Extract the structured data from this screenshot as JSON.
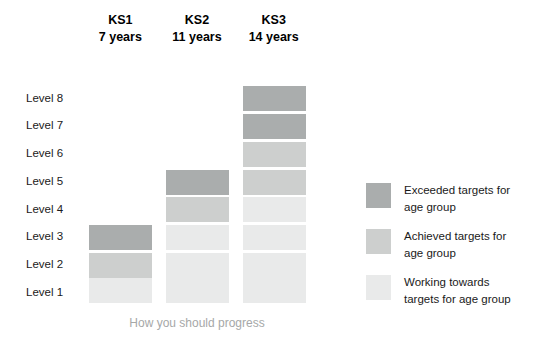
{
  "chart_data": {
    "type": "bar",
    "title": "",
    "caption": "How you should progress",
    "xlabel": "",
    "ylabel": "",
    "categories": [
      "KS1",
      "KS2",
      "KS3"
    ],
    "category_sublabels": [
      "7 years",
      "11 years",
      "14 years"
    ],
    "level_labels": [
      "Level 1",
      "Level 2",
      "Level 3",
      "Level 4",
      "Level 5",
      "Level 6",
      "Level 7",
      "Level 8"
    ],
    "ylim": [
      0,
      8
    ],
    "grid": false,
    "legend_position": "right",
    "series": [
      {
        "name": "Working towards targets for age group",
        "color": "#e9eaea",
        "values": [
          1,
          3,
          4
        ]
      },
      {
        "name": "Achieved targets for age group",
        "color": "#cdcfce",
        "values": [
          1,
          1,
          2
        ]
      },
      {
        "name": "Exceeded targets for age group",
        "color": "#aaadad",
        "values": [
          1,
          1,
          2
        ]
      }
    ],
    "stacks": [
      {
        "category": "KS1",
        "sublabel": "7 years",
        "top_level": 3,
        "segments": [
          {
            "level": 1,
            "status": "working",
            "color": "#e9eaea"
          },
          {
            "level": 2,
            "status": "achieved",
            "color": "#cdcfce"
          },
          {
            "level": 3,
            "status": "exceeded",
            "color": "#aaadad"
          }
        ]
      },
      {
        "category": "KS2",
        "sublabel": "11 years",
        "top_level": 5,
        "segments": [
          {
            "level": 1,
            "status": "working",
            "color": "#e9eaea"
          },
          {
            "level": 2,
            "status": "working",
            "color": "#e9eaea"
          },
          {
            "level": 3,
            "status": "working",
            "color": "#e9eaea"
          },
          {
            "level": 4,
            "status": "achieved",
            "color": "#cdcfce"
          },
          {
            "level": 5,
            "status": "exceeded",
            "color": "#aaadad"
          }
        ]
      },
      {
        "category": "KS3",
        "sublabel": "14 years",
        "top_level": 8,
        "segments": [
          {
            "level": 1,
            "status": "working",
            "color": "#e9eaea"
          },
          {
            "level": 2,
            "status": "working",
            "color": "#e9eaea"
          },
          {
            "level": 3,
            "status": "working",
            "color": "#e9eaea"
          },
          {
            "level": 4,
            "status": "working",
            "color": "#e9eaea"
          },
          {
            "level": 5,
            "status": "achieved",
            "color": "#cdcfce"
          },
          {
            "level": 6,
            "status": "achieved",
            "color": "#cdcfce"
          },
          {
            "level": 7,
            "status": "exceeded",
            "color": "#aaadad"
          },
          {
            "level": 8,
            "status": "exceeded",
            "color": "#aaadad"
          }
        ]
      }
    ],
    "legend": [
      {
        "label_line1": "Exceeded targets for",
        "label_line2": "age group",
        "color": "#aaadad"
      },
      {
        "label_line1": "Achieved targets for",
        "label_line2": "age group",
        "color": "#cdcfce"
      },
      {
        "label_line1": "Working towards",
        "label_line2": "targets for age group",
        "color": "#e9eaea"
      }
    ]
  },
  "colors": {
    "exceeded": "#aaadad",
    "achieved": "#cdcfce",
    "working": "#e9eaea",
    "caption_text": "#a6a8a8",
    "body_text": "#1a1a1a",
    "background": "#ffffff"
  }
}
